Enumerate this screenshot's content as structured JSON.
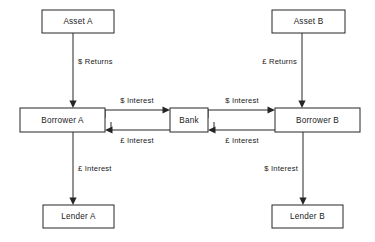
{
  "diagram": {
    "type": "flow-diagram",
    "background_color": "#ffffff",
    "line_color": "#262626",
    "text_color": "#1a1a1a",
    "nodes": [
      {
        "id": "asset-a",
        "label": "Asset A",
        "x": 42,
        "y": 10,
        "w": 72,
        "h": 23
      },
      {
        "id": "asset-b",
        "label": "Asset B",
        "x": 272,
        "y": 10,
        "w": 73,
        "h": 23
      },
      {
        "id": "borrower-a",
        "label": "Borrower A",
        "x": 20,
        "y": 108,
        "w": 85,
        "h": 24
      },
      {
        "id": "bank",
        "label": "Bank",
        "x": 170,
        "y": 108,
        "w": 38,
        "h": 24
      },
      {
        "id": "borrower-b",
        "label": "Borrower B",
        "x": 275,
        "y": 108,
        "w": 85,
        "h": 24
      },
      {
        "id": "lender-a",
        "label": "Lender A",
        "x": 43,
        "y": 205,
        "w": 71,
        "h": 23
      },
      {
        "id": "lender-b",
        "label": "Lender B",
        "x": 272,
        "y": 205,
        "w": 71,
        "h": 23
      }
    ],
    "edges": [
      {
        "id": "asset-a-to-borrower-a",
        "from": "asset-a",
        "to": "borrower-a",
        "label": "$ Returns",
        "direction": "down",
        "label_x": 78,
        "label_y": 62,
        "label_anchor": "start"
      },
      {
        "id": "asset-b-to-borrower-b",
        "from": "asset-b",
        "to": "borrower-b",
        "label": "£ Returns",
        "direction": "down",
        "label_x": 297,
        "label_y": 62,
        "label_anchor": "end"
      },
      {
        "id": "borrower-a-to-bank",
        "from": "borrower-a",
        "to": "bank",
        "label": "$ Interest",
        "direction": "right",
        "label_x": 137,
        "label_y": 101,
        "label_anchor": "middle"
      },
      {
        "id": "bank-to-borrower-a",
        "from": "bank",
        "to": "borrower-a",
        "label": "£ Interest",
        "direction": "left",
        "label_x": 137,
        "label_y": 141,
        "label_anchor": "middle"
      },
      {
        "id": "bank-to-borrower-b",
        "from": "bank",
        "to": "borrower-b",
        "label": "$ Interest",
        "direction": "right",
        "label_x": 242,
        "label_y": 101,
        "label_anchor": "middle"
      },
      {
        "id": "borrower-b-to-bank",
        "from": "borrower-b",
        "to": "bank",
        "label": "£ Interest",
        "direction": "left",
        "label_x": 242,
        "label_y": 141,
        "label_anchor": "middle"
      },
      {
        "id": "borrower-a-to-lender-a",
        "from": "borrower-a",
        "to": "lender-a",
        "label": "£ Interest",
        "direction": "down",
        "label_x": 78,
        "label_y": 169,
        "label_anchor": "start"
      },
      {
        "id": "borrower-b-to-lender-b",
        "from": "borrower-b",
        "to": "lender-b",
        "label": "$ Interest",
        "direction": "down",
        "label_x": 298,
        "label_y": 169,
        "label_anchor": "end"
      }
    ]
  }
}
